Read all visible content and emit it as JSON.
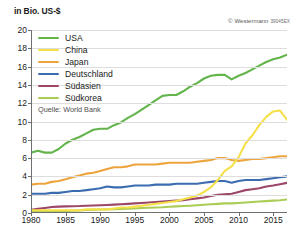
{
  "axis": {
    "y_unit_label": "in Bio. US-$",
    "y_ticks": [
      0,
      2,
      4,
      6,
      8,
      10,
      12,
      14,
      16,
      18,
      20
    ],
    "x_ticks": [
      1980,
      1985,
      1990,
      1995,
      2000,
      2005,
      2010,
      2015
    ]
  },
  "credit": {
    "symbol": "©",
    "publisher": "Westermann",
    "code": "39045EX"
  },
  "source": {
    "label": "Quelle: World Bank"
  },
  "legend": [
    {
      "label": "USA",
      "color": "#63b44b"
    },
    {
      "label": "China",
      "color": "#f5e04a"
    },
    {
      "label": "Japan",
      "color": "#eda43c"
    },
    {
      "label": "Deutschland",
      "color": "#3b6cb0"
    },
    {
      "label": "Südasien",
      "color": "#9c4668"
    },
    {
      "label": "Südkorea",
      "color": "#abcc55"
    }
  ],
  "chart_data": {
    "type": "line",
    "title": "",
    "subtitle": "",
    "xlabel": "",
    "ylabel": "in Bio. US-$",
    "xlim": [
      1980,
      2017
    ],
    "ylim": [
      0,
      20
    ],
    "grid": true,
    "legend_position": "top-left",
    "annotations": [
      "Quelle: World Bank",
      "© Westermann 39045EX"
    ],
    "x": [
      1980,
      1981,
      1982,
      1983,
      1984,
      1985,
      1986,
      1987,
      1988,
      1989,
      1990,
      1991,
      1992,
      1993,
      1994,
      1995,
      1996,
      1997,
      1998,
      1999,
      2000,
      2001,
      2002,
      2003,
      2004,
      2005,
      2006,
      2007,
      2008,
      2009,
      2010,
      2011,
      2012,
      2013,
      2014,
      2015,
      2016,
      2017
    ],
    "series": [
      {
        "name": "USA",
        "color": "#63b44b",
        "values": [
          6.6,
          6.8,
          6.6,
          6.6,
          7.0,
          7.6,
          8.0,
          8.3,
          8.7,
          9.1,
          9.2,
          9.2,
          9.6,
          9.9,
          10.4,
          10.8,
          11.3,
          11.8,
          12.3,
          12.8,
          12.9,
          12.9,
          13.3,
          13.8,
          14.2,
          14.7,
          15.0,
          15.1,
          15.1,
          14.6,
          15.0,
          15.3,
          15.7,
          16.1,
          16.5,
          16.8,
          17.0,
          17.3
        ]
      },
      {
        "name": "China",
        "color": "#f5e04a",
        "values": [
          0.3,
          0.3,
          0.3,
          0.3,
          0.3,
          0.3,
          0.3,
          0.3,
          0.4,
          0.4,
          0.4,
          0.4,
          0.5,
          0.6,
          0.6,
          0.7,
          0.8,
          0.9,
          1.0,
          1.1,
          1.2,
          1.3,
          1.5,
          1.7,
          1.9,
          2.3,
          2.8,
          3.6,
          4.6,
          5.1,
          6.1,
          7.6,
          8.5,
          9.6,
          10.5,
          11.1,
          11.2,
          10.2
        ]
      },
      {
        "name": "Japan",
        "color": "#eda43c",
        "values": [
          3.1,
          3.2,
          3.2,
          3.4,
          3.5,
          3.7,
          3.9,
          4.1,
          4.3,
          4.4,
          4.6,
          4.8,
          5.0,
          5.0,
          5.1,
          5.3,
          5.3,
          5.3,
          5.3,
          5.4,
          5.5,
          5.5,
          5.5,
          5.5,
          5.6,
          5.7,
          5.8,
          6.0,
          6.0,
          5.8,
          5.7,
          5.8,
          5.9,
          5.9,
          6.0,
          6.1,
          6.2,
          6.2
        ]
      },
      {
        "name": "Deutschland",
        "color": "#3b6cb0",
        "values": [
          2.1,
          2.1,
          2.1,
          2.2,
          2.2,
          2.3,
          2.4,
          2.4,
          2.5,
          2.6,
          2.7,
          2.9,
          2.8,
          2.8,
          2.9,
          3.0,
          3.0,
          3.0,
          3.1,
          3.1,
          3.1,
          3.2,
          3.2,
          3.2,
          3.2,
          3.3,
          3.4,
          3.5,
          3.5,
          3.3,
          3.5,
          3.6,
          3.6,
          3.6,
          3.7,
          3.8,
          3.9,
          4.0
        ]
      },
      {
        "name": "Südasien",
        "color": "#9c4668",
        "values": [
          0.35,
          0.45,
          0.55,
          0.65,
          0.7,
          0.72,
          0.74,
          0.76,
          0.8,
          0.82,
          0.85,
          0.88,
          0.92,
          0.96,
          1.0,
          1.05,
          1.1,
          1.15,
          1.2,
          1.25,
          1.3,
          1.35,
          1.4,
          1.5,
          1.6,
          1.7,
          1.85,
          2.0,
          2.05,
          2.1,
          2.3,
          2.5,
          2.6,
          2.7,
          2.9,
          3.0,
          3.15,
          3.3
        ]
      },
      {
        "name": "Südkorea",
        "color": "#abcc55",
        "values": [
          0.1,
          0.12,
          0.15,
          0.18,
          0.2,
          0.22,
          0.25,
          0.28,
          0.32,
          0.35,
          0.38,
          0.4,
          0.42,
          0.44,
          0.46,
          0.5,
          0.55,
          0.58,
          0.6,
          0.63,
          0.68,
          0.72,
          0.76,
          0.8,
          0.85,
          0.9,
          0.95,
          1.0,
          1.05,
          1.05,
          1.1,
          1.15,
          1.2,
          1.25,
          1.3,
          1.35,
          1.4,
          1.48
        ]
      }
    ]
  }
}
